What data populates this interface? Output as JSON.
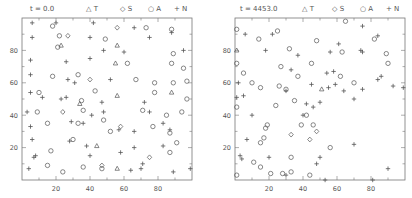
{
  "chart_data": [
    {
      "type": "scatter",
      "title": "t = 0.0",
      "xlabel": "",
      "ylabel": "",
      "xlim": [
        0,
        100
      ],
      "ylim": [
        0,
        100
      ],
      "xticks": [
        20,
        40,
        60,
        80
      ],
      "yticks": [
        20,
        40,
        60,
        80
      ],
      "grid": false,
      "legend": [
        "T",
        "S",
        "A",
        "N"
      ],
      "legend_position": "top",
      "series": [
        {
          "name": "T",
          "marker": "triangle",
          "points": [
            [
              56,
              83
            ],
            [
              23,
              83
            ],
            [
              55,
              72
            ],
            [
              56,
              52
            ],
            [
              34,
              47
            ],
            [
              44,
              21
            ],
            [
              56,
              7
            ],
            [
              88,
              54
            ]
          ]
        },
        {
          "name": "S",
          "marker": "diamond",
          "points": [
            [
              56,
              94
            ],
            [
              27,
              89
            ],
            [
              40,
              62
            ],
            [
              24,
              42
            ],
            [
              58,
              33
            ],
            [
              47,
              9
            ],
            [
              75,
              14
            ]
          ]
        },
        {
          "name": "A",
          "marker": "circle",
          "points": [
            [
              18,
              95
            ],
            [
              22,
              89
            ],
            [
              49,
              87
            ],
            [
              73,
              94
            ],
            [
              88,
              93
            ],
            [
              21,
              82
            ],
            [
              89,
              78
            ],
            [
              88,
              72
            ],
            [
              62,
              72
            ],
            [
              95,
              69
            ],
            [
              67,
              62
            ],
            [
              33,
              65
            ],
            [
              78,
              60
            ],
            [
              89,
              60
            ],
            [
              18,
              64
            ],
            [
              43,
              55
            ],
            [
              78,
              54
            ],
            [
              10,
              54
            ],
            [
              35,
              49
            ],
            [
              36,
              43
            ],
            [
              9,
              42
            ],
            [
              71,
              43
            ],
            [
              15,
              35
            ],
            [
              33,
              35
            ],
            [
              48,
              37
            ],
            [
              77,
              33
            ],
            [
              87,
              29
            ],
            [
              52,
              30
            ],
            [
              30,
              25
            ],
            [
              91,
              23
            ],
            [
              17,
              18
            ],
            [
              15,
              9
            ],
            [
              87,
              17
            ],
            [
              94,
              42
            ],
            [
              97,
              50
            ],
            [
              97,
              61
            ],
            [
              85,
              40
            ],
            [
              24,
              5
            ],
            [
              36,
              8
            ],
            [
              47,
              7
            ]
          ]
        },
        {
          "name": "N",
          "marker": "plus",
          "points": [
            [
              6,
              97
            ],
            [
              20,
              97
            ],
            [
              42,
              97
            ],
            [
              66,
              94
            ],
            [
              88,
              91
            ],
            [
              6,
              88
            ],
            [
              40,
              88
            ],
            [
              75,
              88
            ],
            [
              40,
              75
            ],
            [
              60,
              79
            ],
            [
              95,
              80
            ],
            [
              5,
              74
            ],
            [
              5,
              65
            ],
            [
              26,
              73
            ],
            [
              48,
              80
            ],
            [
              31,
              60
            ],
            [
              5,
              54
            ],
            [
              27,
              62
            ],
            [
              52,
              62
            ],
            [
              12,
              51
            ],
            [
              26,
              51
            ],
            [
              47,
              48
            ],
            [
              72,
              48
            ],
            [
              3,
              42
            ],
            [
              23,
              50
            ],
            [
              48,
              42
            ],
            [
              75,
              42
            ],
            [
              5,
              33
            ],
            [
              29,
              36
            ],
            [
              41,
              40
            ],
            [
              66,
              30
            ],
            [
              83,
              35
            ],
            [
              6,
              25
            ],
            [
              28,
              24
            ],
            [
              36,
              35
            ],
            [
              87,
              31
            ],
            [
              7,
              14
            ],
            [
              40,
              15
            ],
            [
              57,
              31
            ],
            [
              58,
              17
            ],
            [
              83,
              21
            ],
            [
              66,
              20
            ],
            [
              4,
              7
            ],
            [
              8,
              15
            ],
            [
              38,
              21
            ],
            [
              70,
              7
            ],
            [
              89,
              5
            ],
            [
              99,
              7
            ],
            [
              64,
              6
            ],
            [
              71,
              10
            ]
          ]
        }
      ]
    },
    {
      "type": "scatter",
      "title": "t = 4453.0",
      "xlabel": "",
      "ylabel": "",
      "xlim": [
        0,
        100
      ],
      "ylim": [
        0,
        100
      ],
      "xticks": [
        20,
        40,
        60,
        80
      ],
      "yticks": [
        20,
        40,
        60,
        80
      ],
      "grid": false,
      "legend": [
        "T",
        "S",
        "A",
        "N"
      ],
      "legend_position": "top",
      "series": [
        {
          "name": "T",
          "marker": "triangle",
          "points": [
            [
              1,
              80
            ],
            [
              51,
              56
            ]
          ]
        },
        {
          "name": "S",
          "marker": "diamond",
          "points": [
            [
              48,
              30
            ],
            [
              44,
              25
            ],
            [
              33,
              28
            ]
          ]
        },
        {
          "name": "A",
          "marker": "circle",
          "points": [
            [
              1,
              93
            ],
            [
              1,
              72
            ],
            [
              1,
              45
            ],
            [
              1,
              3
            ],
            [
              25,
              92
            ],
            [
              14,
              87
            ],
            [
              32,
              81
            ],
            [
              27,
              70
            ],
            [
              26,
              58
            ],
            [
              30,
              56
            ],
            [
              35,
              49
            ],
            [
              48,
              86
            ],
            [
              24,
              46
            ],
            [
              45,
              72
            ],
            [
              37,
              64
            ],
            [
              63,
              79
            ],
            [
              65,
              98
            ],
            [
              89,
              78
            ],
            [
              90,
              72
            ],
            [
              82,
              87
            ],
            [
              18,
              32
            ],
            [
              17,
              26
            ],
            [
              10,
              60
            ],
            [
              5,
              66
            ],
            [
              15,
              23
            ],
            [
              19,
              34
            ],
            [
              46,
              34
            ],
            [
              11,
              11
            ],
            [
              15,
              8
            ],
            [
              21,
              4
            ],
            [
              28,
              4
            ],
            [
              33,
              14
            ],
            [
              44,
              3
            ],
            [
              33,
              5
            ],
            [
              15,
              57
            ],
            [
              42,
              40
            ],
            [
              39,
              34
            ],
            [
              56,
              20
            ],
            [
              62,
              64
            ],
            [
              70,
              60
            ]
          ]
        },
        {
          "name": "N",
          "marker": "plus",
          "points": [
            [
              6,
              90
            ],
            [
              22,
              90
            ],
            [
              18,
              80
            ],
            [
              37,
              77
            ],
            [
              33,
              68
            ],
            [
              45,
              59
            ],
            [
              54,
              66
            ],
            [
              30,
              55
            ],
            [
              50,
              48
            ],
            [
              55,
              57
            ],
            [
              56,
              79
            ],
            [
              61,
              84
            ],
            [
              75,
              95
            ],
            [
              84,
              89
            ],
            [
              75,
              79
            ],
            [
              86,
              64
            ],
            [
              93,
              58
            ],
            [
              99,
              57
            ],
            [
              84,
              62
            ],
            [
              64,
              55
            ],
            [
              75,
              56
            ],
            [
              70,
              50
            ],
            [
              5,
              52
            ],
            [
              46,
              45
            ],
            [
              42,
              47
            ],
            [
              40,
              40
            ],
            [
              10,
              40
            ],
            [
              2,
              60
            ],
            [
              1,
              51
            ],
            [
              3,
              15
            ],
            [
              4,
              13
            ],
            [
              7,
              25
            ],
            [
              20,
              14
            ],
            [
              30,
              3
            ],
            [
              48,
              10
            ],
            [
              50,
              14
            ],
            [
              53,
              0
            ],
            [
              70,
              22
            ],
            [
              81,
              0
            ],
            [
              90,
              7
            ],
            [
              58,
              67
            ],
            [
              74,
              80
            ],
            [
              59,
              59
            ]
          ]
        }
      ]
    }
  ],
  "panels": [
    {
      "time_label": "t =  0.0"
    },
    {
      "time_label": "t = 4453.0"
    }
  ],
  "legend": [
    {
      "glyph": "△",
      "label": "T"
    },
    {
      "glyph": "◇",
      "label": "S"
    },
    {
      "glyph": "○",
      "label": "A"
    },
    {
      "glyph": "+",
      "label": "N"
    }
  ],
  "colors": {
    "axis": "#777777",
    "marker": "#555555",
    "text": "#555555",
    "background": "#ffffff"
  }
}
